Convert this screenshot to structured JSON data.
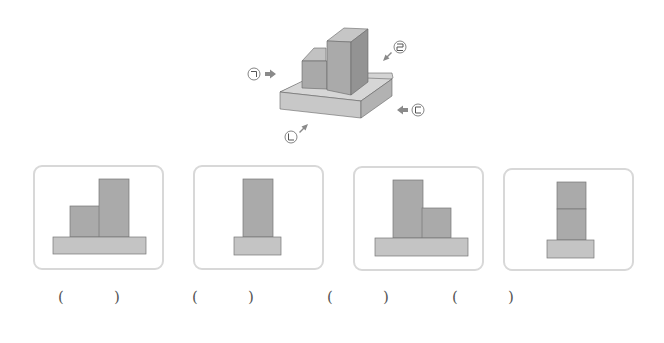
{
  "figure": {
    "direction_labels": [
      {
        "id": "giyeok",
        "symbol": "ㄱ",
        "position": "left"
      },
      {
        "id": "nieun",
        "symbol": "ㄴ",
        "position": "front-left"
      },
      {
        "id": "digeut",
        "symbol": "ㄷ",
        "position": "right"
      },
      {
        "id": "rieul",
        "symbol": "ㄹ",
        "position": "back-right"
      }
    ],
    "colors": {
      "block_front": "#a8a8a8",
      "block_side": "#8e8e8e",
      "block_top": "#c4c4c4",
      "base_top": "#d4d4d4",
      "base_front": "#c6c6c6",
      "base_side": "#b4b4b4",
      "arrow": "#8a8a8a",
      "card_border": "#d8d8d8"
    }
  },
  "options": [
    {
      "id": "option-1",
      "view": "short block left, tall block right, wide base",
      "answer_blank": {
        "open": "(",
        "close": ")"
      }
    },
    {
      "id": "option-2",
      "view": "single tall block, narrow base",
      "answer_blank": {
        "open": "(",
        "close": ")"
      }
    },
    {
      "id": "option-3",
      "view": "tall block left, short block right, wide base",
      "answer_blank": {
        "open": "(",
        "close": ")"
      }
    },
    {
      "id": "option-4",
      "view": "two stacked blocks, narrow base",
      "answer_blank": {
        "open": "(",
        "close": ")"
      }
    }
  ]
}
